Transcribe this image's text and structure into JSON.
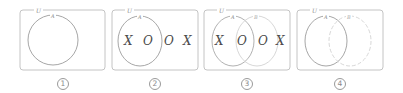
{
  "figure": {
    "colors": {
      "frame": "#c4c4c4",
      "circle_a": "#9c9c9c",
      "circle_b": "#cfcfcf",
      "text_mark": "#4a4a4a",
      "label": "#8a8a8a"
    },
    "panels": [
      {
        "number": "1",
        "universe_label": "U",
        "sets": [
          {
            "label": "A",
            "style": "solid"
          }
        ],
        "marks": []
      },
      {
        "number": "2",
        "universe_label": "U",
        "sets": [
          {
            "label": "A",
            "style": "solid"
          }
        ],
        "marks": [
          "X",
          "O",
          "O",
          "X"
        ]
      },
      {
        "number": "3",
        "universe_label": "U",
        "sets": [
          {
            "label": "A",
            "style": "solid"
          },
          {
            "label": "B",
            "style": "solid-light"
          }
        ],
        "marks": [
          "X",
          "O",
          "O",
          "X"
        ]
      },
      {
        "number": "4",
        "universe_label": "U",
        "sets": [
          {
            "label": "A",
            "style": "solid"
          },
          {
            "label": "B",
            "style": "dashed"
          }
        ],
        "marks": []
      }
    ]
  }
}
